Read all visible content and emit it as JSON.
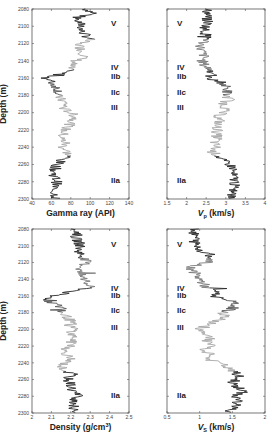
{
  "chart_data": [
    {
      "type": "line",
      "title": "",
      "xlabel": "Gamma ray (API)",
      "ylabel": "Depth (m)",
      "xlim": [
        40,
        140
      ],
      "ylim": [
        2300,
        2080
      ],
      "xticks": [
        "40",
        "60",
        "80",
        "100",
        "120",
        "140"
      ],
      "yticks": [
        "2080",
        "2100",
        "2120",
        "2140",
        "2160",
        "2180",
        "2200",
        "2220",
        "2240",
        "2260",
        "2280",
        "2300"
      ],
      "units": [
        {
          "label": "V",
          "depth": 2096
        },
        {
          "label": "IV",
          "depth": 2147
        },
        {
          "label": "IIb",
          "depth": 2157
        },
        {
          "label": "IIc",
          "depth": 2176
        },
        {
          "label": "III",
          "depth": 2193
        },
        {
          "label": "IIa",
          "depth": 2278
        }
      ],
      "series": [
        {
          "name": "Gamma ray",
          "color_segments": [
            "dark",
            "light",
            "dark",
            "light",
            "dark"
          ],
          "depth": [
            2080,
            2085,
            2090,
            2095,
            2100,
            2105,
            2110,
            2115,
            2120,
            2125,
            2130,
            2135,
            2140,
            2145,
            2150,
            2155,
            2160,
            2165,
            2170,
            2175,
            2180,
            2185,
            2190,
            2195,
            2200,
            2205,
            2210,
            2215,
            2220,
            2225,
            2230,
            2235,
            2240,
            2245,
            2250,
            2255,
            2260,
            2265,
            2270,
            2275,
            2280,
            2285,
            2290,
            2295,
            2300
          ],
          "values": [
            95,
            105,
            85,
            88,
            92,
            90,
            95,
            100,
            88,
            90,
            92,
            95,
            85,
            80,
            78,
            70,
            55,
            60,
            65,
            68,
            66,
            70,
            75,
            72,
            80,
            85,
            82,
            78,
            74,
            72,
            70,
            75,
            72,
            76,
            78,
            70,
            66,
            64,
            62,
            64,
            66,
            64,
            62,
            64,
            65
          ]
        }
      ],
      "grid": false,
      "legend": null
    },
    {
      "type": "line",
      "xlabel": "Vp (km/s)",
      "ylabel": "",
      "xlim": [
        1.5,
        4
      ],
      "ylim": [
        2300,
        2080
      ],
      "xticks": [
        "1.5",
        "2",
        "2.5",
        "3",
        "3.5",
        "4"
      ],
      "units": [
        {
          "label": "V",
          "depth": 2096
        },
        {
          "label": "IV",
          "depth": 2147
        },
        {
          "label": "IIb",
          "depth": 2157
        },
        {
          "label": "IIc",
          "depth": 2176
        },
        {
          "label": "III",
          "depth": 2193
        },
        {
          "label": "IIa",
          "depth": 2278
        }
      ],
      "series": [
        {
          "name": "Vp",
          "depth": [
            2080,
            2085,
            2090,
            2095,
            2100,
            2105,
            2110,
            2115,
            2120,
            2125,
            2130,
            2135,
            2140,
            2145,
            2150,
            2155,
            2160,
            2165,
            2170,
            2175,
            2180,
            2185,
            2190,
            2195,
            2200,
            2205,
            2210,
            2215,
            2220,
            2225,
            2230,
            2235,
            2240,
            2245,
            2250,
            2255,
            2260,
            2265,
            2270,
            2275,
            2280,
            2285,
            2290,
            2295,
            2300
          ],
          "values": [
            2.5,
            2.55,
            2.5,
            2.55,
            2.5,
            2.45,
            2.5,
            2.55,
            2.4,
            2.35,
            2.4,
            2.45,
            2.4,
            2.45,
            2.6,
            2.7,
            2.5,
            2.9,
            3.0,
            3.05,
            3.0,
            3.1,
            2.95,
            3.0,
            2.9,
            2.8,
            2.85,
            2.75,
            2.8,
            2.75,
            2.8,
            2.7,
            2.75,
            2.65,
            2.8,
            2.9,
            3.1,
            3.2,
            3.15,
            3.2,
            3.25,
            3.2,
            3.2,
            3.15,
            3.1
          ]
        }
      ],
      "grid": false,
      "legend": null
    },
    {
      "type": "line",
      "xlabel": "Density (g/cm³)",
      "ylabel": "Depth (m)",
      "xlim": [
        2,
        2.5
      ],
      "ylim": [
        2300,
        2080
      ],
      "xticks": [
        "2",
        "2.1",
        "2.2",
        "2.3",
        "2.4",
        "2.5"
      ],
      "yticks": [
        "2080",
        "2100",
        "2120",
        "2140",
        "2160",
        "2180",
        "2200",
        "2220",
        "2240",
        "2260",
        "2280",
        "2300"
      ],
      "units": [
        {
          "label": "V",
          "depth": 2098
        },
        {
          "label": "IV",
          "depth": 2150
        },
        {
          "label": "IIb",
          "depth": 2159
        },
        {
          "label": "IIc",
          "depth": 2177
        },
        {
          "label": "III",
          "depth": 2197
        },
        {
          "label": "IIa",
          "depth": 2278
        }
      ],
      "series": [
        {
          "name": "Density",
          "depth": [
            2080,
            2085,
            2090,
            2095,
            2100,
            2105,
            2110,
            2115,
            2120,
            2125,
            2130,
            2135,
            2140,
            2145,
            2150,
            2155,
            2160,
            2165,
            2170,
            2175,
            2180,
            2185,
            2190,
            2195,
            2200,
            2205,
            2210,
            2215,
            2220,
            2225,
            2230,
            2235,
            2240,
            2245,
            2250,
            2255,
            2260,
            2265,
            2270,
            2275,
            2280,
            2285,
            2290,
            2295,
            2300
          ],
          "values": [
            2.22,
            2.24,
            2.22,
            2.24,
            2.25,
            2.24,
            2.25,
            2.27,
            2.28,
            2.26,
            2.24,
            2.25,
            2.27,
            2.28,
            2.3,
            2.2,
            2.1,
            2.08,
            2.12,
            2.16,
            2.15,
            2.18,
            2.2,
            2.19,
            2.22,
            2.2,
            2.22,
            2.2,
            2.21,
            2.16,
            2.18,
            2.2,
            2.17,
            2.15,
            2.18,
            2.2,
            2.18,
            2.2,
            2.2,
            2.22,
            2.24,
            2.22,
            2.22,
            2.2,
            2.25
          ]
        }
      ],
      "grid": false,
      "legend": null
    },
    {
      "type": "line",
      "xlabel": "Vs (km/s)",
      "ylabel": "",
      "xlim": [
        0.5,
        2
      ],
      "ylim": [
        2300,
        2080
      ],
      "xticks": [
        "0.5",
        "1",
        "1.5",
        "2"
      ],
      "units": [
        {
          "label": "V",
          "depth": 2098
        },
        {
          "label": "IV",
          "depth": 2150
        },
        {
          "label": "IIb",
          "depth": 2159
        },
        {
          "label": "IIc",
          "depth": 2177
        },
        {
          "label": "III",
          "depth": 2197
        },
        {
          "label": "IIa",
          "depth": 2278
        }
      ],
      "series": [
        {
          "name": "Vs",
          "depth": [
            2080,
            2085,
            2090,
            2095,
            2100,
            2105,
            2110,
            2115,
            2120,
            2125,
            2130,
            2135,
            2140,
            2145,
            2150,
            2155,
            2160,
            2165,
            2170,
            2175,
            2180,
            2185,
            2190,
            2195,
            2200,
            2205,
            2210,
            2215,
            2220,
            2225,
            2230,
            2235,
            2240,
            2245,
            2250,
            2255,
            2260,
            2265,
            2270,
            2275,
            2280,
            2285,
            2290,
            2295,
            2300
          ],
          "values": [
            0.95,
            0.9,
            0.95,
            0.92,
            0.95,
            1.0,
            1.15,
            1.2,
            1.1,
            0.85,
            0.9,
            0.95,
            1.0,
            1.05,
            1.1,
            1.3,
            1.2,
            1.45,
            1.55,
            1.5,
            1.35,
            1.4,
            1.25,
            1.1,
            1.0,
            1.1,
            1.15,
            1.1,
            1.2,
            1.05,
            1.2,
            1.1,
            1.3,
            1.4,
            1.5,
            1.6,
            1.55,
            1.5,
            1.6,
            1.65,
            1.55,
            1.6,
            1.55,
            1.5,
            1.45
          ]
        }
      ],
      "grid": false,
      "legend": null
    }
  ],
  "labels": {
    "depth_axis": "Depth (m)",
    "gamma_xlabel": "Gamma ray (API)",
    "vp_xlabel": "V",
    "vp_sub": "p",
    "vp_unit": " (km/s)",
    "density_xlabel": "Density (g/cm",
    "density_sup": "3",
    "density_close": ")",
    "vs_xlabel": "V",
    "vs_sub": "S",
    "vs_unit": " (km/s)"
  },
  "colors": {
    "dark": "#2a2a2a",
    "light": "#a8a8a8",
    "frame": "#555555"
  }
}
